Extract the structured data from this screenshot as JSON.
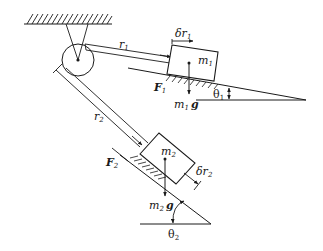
{
  "diagram": {
    "type": "mechanics-free-body",
    "colors": {
      "stroke": "#1a1a1a",
      "background": "#ffffff"
    },
    "labels": {
      "r1": "r",
      "r1_sub": "1",
      "r2": "r",
      "r2_sub": "2",
      "dr1": "δr",
      "dr1_sub": "1",
      "dr2": "δr",
      "dr2_sub": "2",
      "m1": "m",
      "m1_sub": "1",
      "m2": "m",
      "m2_sub": "2",
      "m1g_m": "m",
      "m1g_sub": "1",
      "m1g_g": "g",
      "m2g_m": "m",
      "m2g_sub": "2",
      "m2g_g": "g",
      "F1": "F",
      "F1_sub": "1",
      "F2": "F",
      "F2_sub": "2",
      "theta1": "θ",
      "theta1_sub": "1",
      "theta2": "θ",
      "theta2_sub": "2"
    }
  }
}
